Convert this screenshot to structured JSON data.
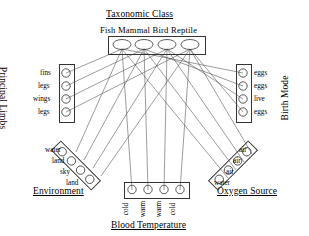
{
  "diagram": {
    "groups": {
      "taxonomic_class": {
        "title": "Taxonomic Class",
        "names_line": "Fish Mammal Bird Reptile",
        "nodes": [
          {
            "label": "Fish"
          },
          {
            "label": "Mammal"
          },
          {
            "label": "Bird"
          },
          {
            "label": "Reptile"
          }
        ]
      },
      "principal_limbs": {
        "title": "Principal Limbs",
        "nodes": [
          {
            "label": "fins"
          },
          {
            "label": "legs"
          },
          {
            "label": "wings"
          },
          {
            "label": "legs"
          }
        ]
      },
      "birth_mode": {
        "title": "Birth Mode",
        "nodes": [
          {
            "label": "eggs"
          },
          {
            "label": "eggs"
          },
          {
            "label": "live"
          },
          {
            "label": "eggs"
          }
        ]
      },
      "environment": {
        "title": "Environment",
        "nodes": [
          {
            "label": "water"
          },
          {
            "label": "land"
          },
          {
            "label": "sky"
          },
          {
            "label": "land"
          }
        ]
      },
      "oxygen_source": {
        "title": "Oxygen Source",
        "nodes": [
          {
            "label": "air"
          },
          {
            "label": "air"
          },
          {
            "label": "air"
          },
          {
            "label": "water"
          }
        ]
      },
      "blood_temperature": {
        "title": "Blood Temperature",
        "nodes": [
          {
            "label": "cold"
          },
          {
            "label": "warm"
          },
          {
            "label": "warm"
          },
          {
            "label": "cold"
          }
        ]
      }
    },
    "colors": {
      "line": "#4a4a4a",
      "node_stroke": "#333333",
      "background": "#ffffff",
      "text": "#000000"
    }
  }
}
